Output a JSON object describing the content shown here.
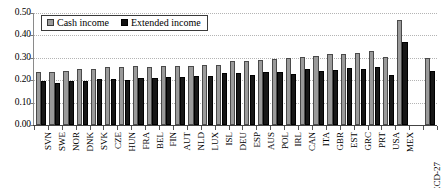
{
  "chart_data": {
    "type": "bar",
    "title": "",
    "subtitle": "",
    "xlabel": "",
    "ylabel": "",
    "ylim": [
      0.0,
      0.5
    ],
    "ytick_labels": [
      "0.00",
      "0.10",
      "0.20",
      "0.30",
      "0.40",
      "0.50"
    ],
    "ytick_values": [
      0.0,
      0.1,
      0.2,
      0.3,
      0.4,
      0.5
    ],
    "grid": true,
    "legend_position": "top-left",
    "categories": [
      "SVN",
      "SWE",
      "NOR",
      "DNK",
      "SVK",
      "CZE",
      "HUN",
      "FRA",
      "BEL",
      "FIN",
      "AUT",
      "NLD",
      "LUX",
      "ISL",
      "DEU",
      "ESP",
      "AUS",
      "POL",
      "IRL",
      "CAN",
      "ITA",
      "GBR",
      "EST",
      "GRC",
      "PRT",
      "USA",
      "MEX",
      "",
      "OECD-27"
    ],
    "series": [
      {
        "name": "Cash income",
        "color": "#9a9a9a",
        "values": [
          0.235,
          0.236,
          0.24,
          0.248,
          0.25,
          0.257,
          0.258,
          0.262,
          0.257,
          0.262,
          0.263,
          0.263,
          0.269,
          0.27,
          0.286,
          0.287,
          0.29,
          0.294,
          0.299,
          0.303,
          0.31,
          0.319,
          0.319,
          0.323,
          0.329,
          0.303,
          0.47,
          null,
          0.3
        ]
      },
      {
        "name": "Extended income",
        "color": "#171717",
        "values": [
          0.196,
          0.186,
          0.196,
          0.197,
          0.204,
          0.207,
          0.201,
          0.21,
          0.208,
          0.214,
          0.216,
          0.218,
          0.219,
          0.231,
          0.23,
          0.224,
          0.236,
          0.237,
          0.226,
          0.25,
          0.239,
          0.245,
          0.256,
          0.25,
          0.258,
          0.222,
          0.372,
          null,
          0.239
        ]
      }
    ]
  },
  "legend": {
    "cash_label": "Cash income",
    "extended_label": "Extended income"
  }
}
